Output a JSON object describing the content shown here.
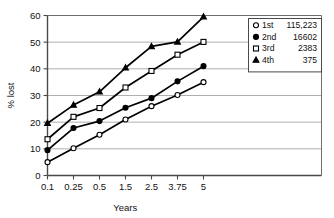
{
  "chart_data": {
    "type": "line",
    "title": "",
    "xlabel": "Years",
    "ylabel": "% lost",
    "categories": [
      "0.1",
      "0.25",
      "0.5",
      "1.5",
      "2.5",
      "3.75",
      "5"
    ],
    "x_tick_labels": [
      "0.1",
      "0.25",
      "0.5",
      "1.5",
      "2.5",
      "3.75",
      "5"
    ],
    "y_tick_labels": [
      "0",
      "10",
      "20",
      "30",
      "40",
      "50",
      "60"
    ],
    "y_ticks": [
      0,
      10,
      20,
      30,
      40,
      50,
      60
    ],
    "ylim": [
      0,
      60
    ],
    "grid": "horizontal",
    "legend_position": "top-right",
    "series": [
      {
        "name": "1st",
        "count": "115,223",
        "marker": "open-circle",
        "values": [
          5,
          10.2,
          15.3,
          21,
          26,
          30.2,
          35
        ]
      },
      {
        "name": "2nd",
        "count": "16602",
        "marker": "filled-circle",
        "values": [
          9.5,
          17.8,
          20.4,
          25.4,
          29,
          35.3,
          41
        ]
      },
      {
        "name": "3rd",
        "count": "2383",
        "marker": "open-square",
        "values": [
          13.6,
          22,
          25.3,
          33,
          39.2,
          45.3,
          50.1
        ]
      },
      {
        "name": "4th",
        "count": "375",
        "marker": "filled-triangle",
        "values": [
          19.6,
          26.4,
          31.4,
          40.4,
          48.4,
          50.1,
          59.5
        ]
      }
    ],
    "colors": {
      "line": "#000000",
      "marker_fill_open": "#ffffff",
      "grid": "#9a9a9a",
      "axis": "#4a4a4a",
      "background": "#ffffff"
    }
  }
}
